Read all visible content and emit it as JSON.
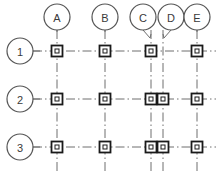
{
  "drawing": {
    "title": "Structural Column Grid Plan",
    "type": "column-grid",
    "canvas": {
      "width": 223,
      "height": 171
    },
    "style": {
      "line_color": "#6e6e6e",
      "bubble_stroke": "#555555",
      "text_color": "#3a3a3a",
      "column_fill": "#ffffff",
      "column_stroke": "#1a1a1a",
      "background": "#ffffff",
      "gridline_pattern": "dash-dot"
    },
    "column_grid_labels": [
      {
        "id": "A",
        "label": "A",
        "cx": 57,
        "cy": 17,
        "r": 13,
        "leader": "straight",
        "axis_x": 57
      },
      {
        "id": "B",
        "label": "B",
        "cx": 105,
        "cy": 17,
        "r": 13,
        "leader": "straight",
        "axis_x": 105
      },
      {
        "id": "C",
        "label": "C",
        "cx": 143,
        "cy": 17,
        "r": 13,
        "leader": "angled-right",
        "axis_x": 151
      },
      {
        "id": "D",
        "label": "D",
        "cx": 171,
        "cy": 17,
        "r": 13,
        "leader": "angled-left",
        "axis_x": 163
      },
      {
        "id": "E",
        "label": "E",
        "cx": 197,
        "cy": 17,
        "r": 13,
        "leader": "straight",
        "axis_x": 197
      }
    ],
    "row_grid_labels": [
      {
        "id": "1",
        "label": "1",
        "cx": 20,
        "cy": 51,
        "r": 13,
        "axis_y": 51
      },
      {
        "id": "2",
        "label": "2",
        "cx": 20,
        "cy": 99,
        "r": 13,
        "axis_y": 99
      },
      {
        "id": "3",
        "label": "3",
        "cx": 20,
        "cy": 147,
        "r": 13,
        "axis_y": 147
      }
    ],
    "vertical_gridlines": [
      {
        "axis": "A",
        "x": 57,
        "y1": 30,
        "y2": 171
      },
      {
        "axis": "B",
        "x": 105,
        "y1": 30,
        "y2": 171
      },
      {
        "axis": "C",
        "x": 151,
        "y1": 30,
        "y2": 171
      },
      {
        "axis": "D",
        "x": 163,
        "y1": 30,
        "y2": 171
      },
      {
        "axis": "E",
        "x": 197,
        "y1": 30,
        "y2": 171
      }
    ],
    "horizontal_gridlines": [
      {
        "axis": "1",
        "y": 51,
        "x1": 33,
        "x2": 216
      },
      {
        "axis": "2",
        "y": 99,
        "x1": 33,
        "x2": 216
      },
      {
        "axis": "3",
        "y": 147,
        "x1": 33,
        "x2": 216
      }
    ],
    "columns": [
      {
        "grid_ref": "A-1",
        "x": 57,
        "y": 51,
        "size": 11
      },
      {
        "grid_ref": "B-1",
        "x": 105,
        "y": 51,
        "size": 11
      },
      {
        "grid_ref": "C-1",
        "x": 151,
        "y": 51,
        "size": 11
      },
      {
        "grid_ref": "E-1",
        "x": 197,
        "y": 51,
        "size": 11
      },
      {
        "grid_ref": "A-2",
        "x": 57,
        "y": 99,
        "size": 11
      },
      {
        "grid_ref": "B-2",
        "x": 105,
        "y": 99,
        "size": 11
      },
      {
        "grid_ref": "C-2",
        "x": 151,
        "y": 99,
        "size": 11
      },
      {
        "grid_ref": "D-2",
        "x": 163,
        "y": 99,
        "size": 11
      },
      {
        "grid_ref": "E-2",
        "x": 197,
        "y": 99,
        "size": 11
      },
      {
        "grid_ref": "A-3",
        "x": 57,
        "y": 147,
        "size": 11
      },
      {
        "grid_ref": "B-3",
        "x": 105,
        "y": 147,
        "size": 11
      },
      {
        "grid_ref": "C-3",
        "x": 151,
        "y": 147,
        "size": 11
      },
      {
        "grid_ref": "D-3",
        "x": 163,
        "y": 147,
        "size": 11
      },
      {
        "grid_ref": "E-3",
        "x": 197,
        "y": 147,
        "size": 11
      }
    ]
  }
}
